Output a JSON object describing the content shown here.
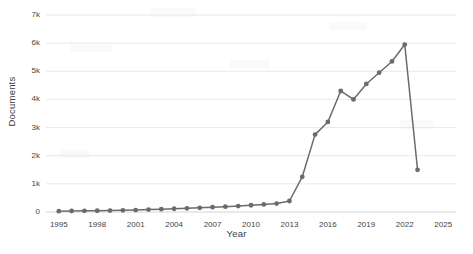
{
  "chart_data": {
    "type": "line",
    "title": "",
    "xlabel": "Year",
    "ylabel": "Documents",
    "xlim": [
      1994,
      2026
    ],
    "ylim": [
      0,
      7000
    ],
    "grid": true,
    "legend": false,
    "line_color": "#6b6b6b",
    "marker_color": "#6b6b6b",
    "x_tick_labels": [
      "1995",
      "1998",
      "2001",
      "2004",
      "2007",
      "2010",
      "2013",
      "2016",
      "2019",
      "2022",
      "2025"
    ],
    "x_tick_values": [
      1995,
      1998,
      2001,
      2004,
      2007,
      2010,
      2013,
      2016,
      2019,
      2022,
      2025
    ],
    "y_tick_labels": [
      "0",
      "1k",
      "2k",
      "3k",
      "4k",
      "5k",
      "6k",
      "7k"
    ],
    "y_tick_values": [
      0,
      1000,
      2000,
      3000,
      4000,
      5000,
      6000,
      7000
    ],
    "x": [
      1995,
      1996,
      1997,
      1998,
      1999,
      2000,
      2001,
      2002,
      2003,
      2004,
      2005,
      2006,
      2007,
      2008,
      2009,
      2010,
      2011,
      2012,
      2013,
      2014,
      2015,
      2016,
      2017,
      2018,
      2019,
      2020,
      2021,
      2022,
      2023
    ],
    "values": [
      30,
      35,
      40,
      45,
      50,
      60,
      70,
      85,
      100,
      115,
      130,
      150,
      170,
      190,
      210,
      240,
      270,
      300,
      390,
      1250,
      2750,
      3200,
      4300,
      4000,
      4550,
      4950,
      5350,
      5950,
      1500
    ],
    "series": [
      {
        "name": "Documents",
        "values": [
          30,
          35,
          40,
          45,
          50,
          60,
          70,
          85,
          100,
          115,
          130,
          150,
          170,
          190,
          210,
          240,
          270,
          300,
          390,
          1250,
          2750,
          3200,
          4300,
          4000,
          4550,
          4950,
          5350,
          5950,
          1500
        ]
      }
    ]
  }
}
